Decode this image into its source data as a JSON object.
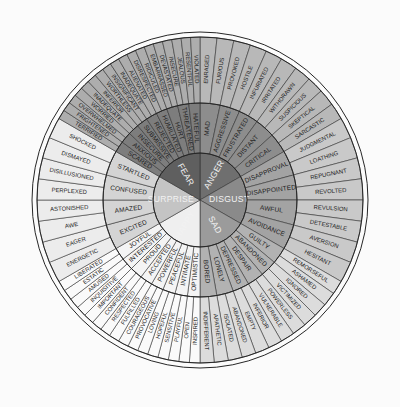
{
  "figure": {
    "name": "feelings-wheel",
    "type": "radial-hierarchy",
    "background_color": "#fbfbfb",
    "center": {
      "x": 200,
      "y": 200
    },
    "radii": {
      "core": 47,
      "middle": 97,
      "outer": 163,
      "border": 168
    },
    "rings": [
      "core",
      "middle",
      "outer"
    ],
    "colors": {
      "anger": "#6f6f6f",
      "anger_mid": "#8d8d8d",
      "anger_outer": "#b8b8b8",
      "disgust": "#8a8a8a",
      "disgust_mid": "#a3a3a3",
      "disgust_outer": "#c9c9c9",
      "sad": "#9b9b9b",
      "sad_mid": "#b2b2b2",
      "sad_outer": "#dcdcdc",
      "happy": "#efefef",
      "happy_mid": "#f4f4f4",
      "happy_outer": "#fafafa",
      "surprise": "#c4c4c4",
      "surprise_mid": "#d4d4d4",
      "surprise_outer": "#ececec",
      "fear": "#5f5f5f",
      "fear_mid": "#7d7d7d",
      "fear_outer": "#adadad",
      "stroke": "#2a2a2a",
      "core_text": "#f2f2f2",
      "text": "#1d1d1d"
    }
  },
  "wheel": {
    "core_emotions": [
      {
        "name": "ANGER",
        "color_key": "anger",
        "start_angle": -90,
        "end_angle": -30,
        "secondary": [
          {
            "name": "MAD",
            "tertiary": [
              "ENRAGED",
              "FURIOUS"
            ]
          },
          {
            "name": "AGGRESSIVE",
            "tertiary": [
              "PROVOKED",
              "HOSTILE"
            ]
          },
          {
            "name": "FRUSTRATED",
            "tertiary": [
              "INFURIATED",
              "IRRITATED"
            ]
          },
          {
            "name": "DISTANT",
            "tertiary": [
              "WITHDRAWN",
              "SUSPICIOUS"
            ]
          },
          {
            "name": "CRITICAL",
            "tertiary": [
              "SKEPTICAL",
              "SARCASTIC"
            ]
          }
        ]
      },
      {
        "name": "DISGUST",
        "color_key": "disgust",
        "start_angle": -30,
        "end_angle": 30,
        "secondary": [
          {
            "name": "DISAPPROVAL",
            "tertiary": [
              "JUDGMENTAL",
              "LOATHING"
            ]
          },
          {
            "name": "DISAPPOINTED",
            "tertiary": [
              "REPUGNANT",
              "REVOLTED"
            ]
          },
          {
            "name": "AWFUL",
            "tertiary": [
              "REVULSION",
              "DETESTABLE"
            ]
          },
          {
            "name": "AVOIDANCE",
            "tertiary": [
              "AVERSION",
              "HESITANT"
            ]
          }
        ]
      },
      {
        "name": "SAD",
        "color_key": "sad",
        "start_angle": 30,
        "end_angle": 90,
        "secondary": [
          {
            "name": "GUILTY",
            "tertiary": [
              "REMORSEFUL",
              "ASHAMED"
            ]
          },
          {
            "name": "ABANDONED",
            "tertiary": [
              "IGNORED",
              "VICTIMIZED"
            ]
          },
          {
            "name": "DESPAIR",
            "tertiary": [
              "POWERLESS",
              "VULNERABLE"
            ]
          },
          {
            "name": "DEPRESSED",
            "tertiary": [
              "INFERIOR",
              "EMPTY"
            ]
          },
          {
            "name": "LONELY",
            "tertiary": [
              "ABANDONED",
              "ISOLATED"
            ]
          },
          {
            "name": "BORED",
            "tertiary": [
              "APATHETIC",
              "INDIFFERENT"
            ]
          }
        ]
      },
      {
        "name": "HAPPY",
        "color_key": "happy",
        "start_angle": 90,
        "end_angle": 150,
        "secondary": [
          {
            "name": "OPTIMISTIC",
            "tertiary": [
              "INSPIRED",
              "OPEN"
            ]
          },
          {
            "name": "INTIMATE",
            "tertiary": [
              "PLAYFUL",
              "SENSITIVE"
            ]
          },
          {
            "name": "PEACEFUL",
            "tertiary": [
              "HOPEFUL",
              "LOVING"
            ]
          },
          {
            "name": "POWERFUL",
            "tertiary": [
              "PROVOCATIVE",
              "COURAGEOUS"
            ]
          },
          {
            "name": "ACCEPTED",
            "tertiary": [
              "FULFILLED",
              "RESPECTED"
            ]
          },
          {
            "name": "PROUD",
            "tertiary": [
              "CONFIDENT",
              "IMPORTANT"
            ]
          },
          {
            "name": "INTERESTED",
            "tertiary": [
              "INQUISITIVE",
              "AMUSED"
            ]
          },
          {
            "name": "JOYFUL",
            "tertiary": [
              "ESTATIC",
              "LIBERATED"
            ]
          }
        ]
      },
      {
        "name": "SURPRISE",
        "color_key": "surprise",
        "start_angle": 150,
        "end_angle": 210,
        "secondary": [
          {
            "name": "EXCITED",
            "tertiary": [
              "ENERGETIC",
              "EAGER"
            ]
          },
          {
            "name": "AMAZED",
            "tertiary": [
              "AWE",
              "ASTONISHED"
            ]
          },
          {
            "name": "CONFUSED",
            "tertiary": [
              "PERPLEXED",
              "DISILLUSIONED"
            ]
          },
          {
            "name": "STARTLED",
            "tertiary": [
              "DISMAYED",
              "SHOCKED"
            ]
          }
        ]
      },
      {
        "name": "FEAR",
        "color_key": "fear",
        "start_angle": 210,
        "end_angle": 270,
        "secondary": [
          {
            "name": "SCARED",
            "tertiary": [
              "TERRIFIED",
              "FRIGHTENED"
            ]
          },
          {
            "name": "ANXIOUS",
            "tertiary": [
              "OVERWHELMED",
              "WORRIED"
            ]
          },
          {
            "name": "INSECURE",
            "tertiary": [
              "INADEQUATE",
              "INFERIOR"
            ]
          },
          {
            "name": "SUBMISSIVE",
            "tertiary": [
              "WORTHLESS",
              "INSIGNIFICANT"
            ]
          },
          {
            "name": "REJECTED",
            "tertiary": [
              "INADEQUATE",
              "ALIENATED"
            ]
          },
          {
            "name": "HUMILIATED",
            "tertiary": [
              "DISRESPECTED",
              "RIDICULED"
            ]
          },
          {
            "name": "HURT",
            "tertiary": [
              "EMBARRASSED",
              "DEVASTATED"
            ]
          },
          {
            "name": "THREATENED",
            "tertiary": [
              "INSECURE",
              "JEALOUS"
            ]
          },
          {
            "name": "HATEFUL",
            "tertiary": [
              "RESENTFUL",
              "VIOLATED"
            ]
          }
        ]
      }
    ]
  }
}
